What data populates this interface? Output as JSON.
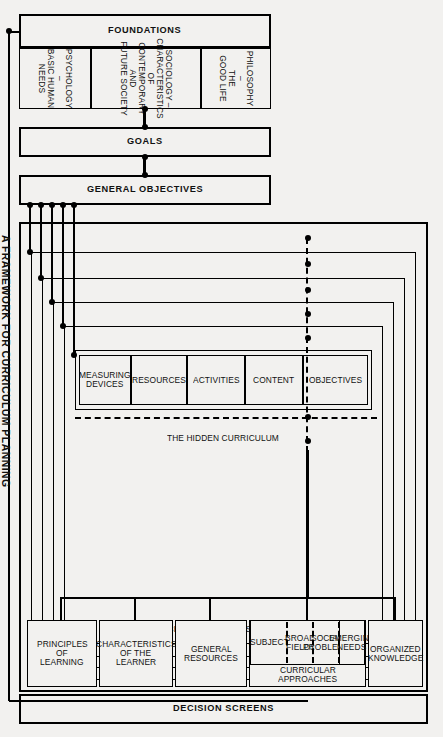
{
  "diagram": {
    "caption": "A FRAMEWORK FOR CURRICULUM PLANNING",
    "panels": {
      "decision_screens": {
        "title": "DECISION SCREENS",
        "items": [
          {
            "label": "PRINCIPLES\nOF\nLEARNING"
          },
          {
            "label": "CHARACTERISTICS\nOF THE\nLEARNER"
          },
          {
            "label": "GENERAL\nRESOURCES"
          },
          {
            "label": "CURRICULAR APPROACHES",
            "children": [
              {
                "label": "SUBJECT"
              },
              {
                "label": "BROAD\nFIELDS"
              },
              {
                "label": "SOCIAL\nPROBLEMS"
              },
              {
                "label": "EMERGING\nNEEDS"
              }
            ]
          },
          {
            "label": "ORGANIZED\nKNOWLEDGE"
          }
        ]
      },
      "curriculum_plans": {
        "title": "CURRICULUM PLANS",
        "nested": [
          {
            "label": "NATIONAL AND/OR STATE PLANS"
          },
          {
            "label": "DISTRICTWIDE PLANS"
          },
          {
            "label": "ALL-SCHOOL PROGRAM"
          },
          {
            "label": "TEACHING–LEARNING SITUATIONS"
          }
        ],
        "elements": [
          {
            "label": "OBJECTIVES"
          },
          {
            "label": "CONTENT"
          },
          {
            "label": "ACTIVITIES"
          },
          {
            "label": "RESOURCES"
          },
          {
            "label": "MEASURING\nDEVICES"
          }
        ],
        "hidden_curriculum": "THE HIDDEN CURRICULUM"
      },
      "general_objectives": {
        "title": "GENERAL OBJECTIVES"
      },
      "goals": {
        "title": "GOALS"
      },
      "foundations": {
        "title": "FOUNDATIONS",
        "items": [
          {
            "label": "PHILOSOPHY –\nTHE\nGOOD LIFE"
          },
          {
            "label": "SOCIOLOGY –\nCHARACTERISTICS\nOF\nCONTEMPORARY\nAND\nFUTURE SOCIETY"
          },
          {
            "label": "PSYCHOLOGY –\nBASIC HUMAN\nNEEDS"
          }
        ]
      }
    }
  }
}
